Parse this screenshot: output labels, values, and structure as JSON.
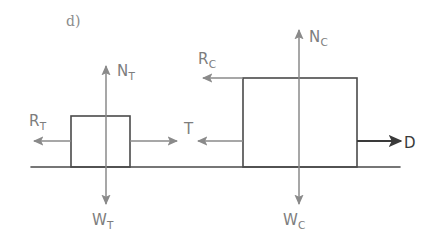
{
  "figure": {
    "panel_label": "d)",
    "colors": {
      "stroke_gray": "#8a8a8a",
      "stroke_dark": "#3a3a3a",
      "box_outline": "#4a4a4a",
      "ground": "#4a4a4a",
      "text_gray": "#7d7d7d",
      "background": "#ffffff"
    }
  },
  "bodies": [
    {
      "id": "trailer",
      "name": "trailer-box",
      "x": 71,
      "y": 116,
      "width": 59,
      "height": 51
    },
    {
      "id": "car",
      "name": "car-box",
      "x": 243,
      "y": 78,
      "width": 114,
      "height": 89
    }
  ],
  "ground": {
    "label": "ground-line",
    "x1": 31,
    "y1": 167,
    "x2": 400,
    "y2": 167
  },
  "forces": [
    {
      "id": "N_T",
      "base": "N",
      "subscript": "T",
      "body": "trailer",
      "direction": "up",
      "color": "#8a8a8a",
      "label_x": 117,
      "label_y": 76,
      "arrow": {
        "x1": 106,
        "y1": 167,
        "x2": 106,
        "y2": 66
      }
    },
    {
      "id": "R_T",
      "base": "R",
      "subscript": "T",
      "body": "trailer",
      "direction": "left",
      "color": "#8a8a8a",
      "label_x": 29,
      "label_y": 126,
      "arrow": {
        "x1": 71,
        "y1": 141,
        "x2": 34,
        "y2": 141
      }
    },
    {
      "id": "W_T",
      "base": "W",
      "subscript": "T",
      "body": "trailer",
      "direction": "down",
      "color": "#8a8a8a",
      "label_x": 92,
      "label_y": 225,
      "arrow": {
        "x1": 106,
        "y1": 167,
        "x2": 106,
        "y2": 204
      }
    },
    {
      "id": "T_trailer",
      "base": "T",
      "subscript": "",
      "body": "trailer",
      "direction": "right",
      "color": "#8a8a8a",
      "label_x": 184,
      "label_y": 134,
      "arrow": {
        "x1": 130,
        "y1": 141,
        "x2": 177,
        "y2": 141
      }
    },
    {
      "id": "T_car",
      "base": "T",
      "subscript": "",
      "body": "car",
      "direction": "left",
      "color": "#8a8a8a",
      "label_x": null,
      "label_y": null,
      "arrow": {
        "x1": 243,
        "y1": 141,
        "x2": 198,
        "y2": 141
      }
    },
    {
      "id": "N_C",
      "base": "N",
      "subscript": "C",
      "body": "car",
      "direction": "up",
      "color": "#8a8a8a",
      "label_x": 309,
      "label_y": 42,
      "arrow": {
        "x1": 299,
        "y1": 167,
        "x2": 299,
        "y2": 30
      }
    },
    {
      "id": "R_C",
      "base": "R",
      "subscript": "C",
      "body": "car",
      "direction": "left",
      "color": "#8a8a8a",
      "label_x": 198,
      "label_y": 64,
      "arrow": {
        "x1": 243,
        "y1": 78,
        "x2": 203,
        "y2": 78
      }
    },
    {
      "id": "W_C",
      "base": "W",
      "subscript": "C",
      "body": "car",
      "direction": "down",
      "color": "#8a8a8a",
      "label_x": 283,
      "label_y": 225,
      "arrow": {
        "x1": 299,
        "y1": 167,
        "x2": 299,
        "y2": 204
      }
    },
    {
      "id": "D",
      "base": "D",
      "subscript": "",
      "body": "car",
      "direction": "right",
      "color": "#3a3a3a",
      "label_x": 404,
      "label_y": 148,
      "arrow": {
        "x1": 357,
        "y1": 141,
        "x2": 401,
        "y2": 141
      }
    }
  ]
}
